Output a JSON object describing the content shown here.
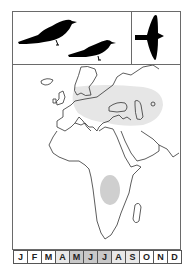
{
  "card": {
    "subject": "migratory bird range map",
    "illustrations": {
      "perched": [
        "bird-silhouette-perched-large",
        "bird-silhouette-perched-small"
      ],
      "flight": "bird-silhouette-flying"
    }
  },
  "map": {
    "region": "Europe, Africa and western Asia",
    "ranges": [
      {
        "name": "breeding-range",
        "area": "Eastern Europe to Central Asia",
        "color": "#e6e6e6"
      },
      {
        "name": "wintering-range",
        "area": "East Africa",
        "color": "#cfcfcf"
      }
    ]
  },
  "calendar": {
    "months": [
      {
        "label": "J",
        "shade": "#ffffff"
      },
      {
        "label": "F",
        "shade": "#ffffff"
      },
      {
        "label": "M",
        "shade": "#ffffff"
      },
      {
        "label": "A",
        "shade": "#e8e8e8"
      },
      {
        "label": "M",
        "shade": "#c8c8c8"
      },
      {
        "label": "J",
        "shade": "#c8c8c8"
      },
      {
        "label": "J",
        "shade": "#c8c8c8"
      },
      {
        "label": "A",
        "shade": "#e8e8e8"
      },
      {
        "label": "S",
        "shade": "#e8e8e8"
      },
      {
        "label": "O",
        "shade": "#ffffff"
      },
      {
        "label": "N",
        "shade": "#ffffff"
      },
      {
        "label": "D",
        "shade": "#ffffff"
      }
    ]
  }
}
